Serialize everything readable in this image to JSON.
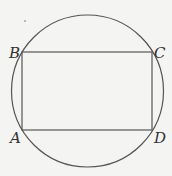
{
  "diagram": {
    "circle": {
      "cx": 87.5,
      "cy": 91,
      "r": 76
    },
    "rectangle": {
      "x": 22,
      "y": 52,
      "width": 130,
      "height": 78
    },
    "points": [
      {
        "label": "A",
        "x": 22,
        "y": 130
      },
      {
        "label": "B",
        "x": 22,
        "y": 52
      },
      {
        "label": "C",
        "x": 152,
        "y": 52
      },
      {
        "label": "D",
        "x": 152,
        "y": 130
      }
    ],
    "stroke_color": "#555555"
  }
}
